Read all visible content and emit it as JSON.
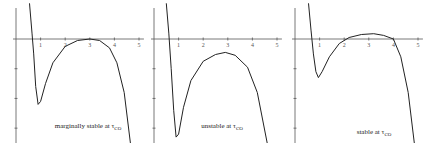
{
  "chart_data": [
    {
      "type": "line",
      "title": "",
      "caption": "marginally stable at τ",
      "caption_sub": "CO",
      "xlabel": "",
      "ylabel": "",
      "xlim": [
        0,
        5.2
      ],
      "ylim": [
        -3.5,
        1.2
      ],
      "x_ticks": [
        "1",
        "2",
        "3",
        "4",
        "5"
      ],
      "series": [
        {
          "name": "curve",
          "points": [
            [
              0.55,
              1.2
            ],
            [
              0.65,
              0.2
            ],
            [
              0.72,
              -0.5
            ],
            [
              0.8,
              -1.6
            ],
            [
              0.9,
              -2.2
            ],
            [
              1.0,
              -2.1
            ],
            [
              1.2,
              -1.5
            ],
            [
              1.5,
              -0.8
            ],
            [
              2.0,
              -0.25
            ],
            [
              2.5,
              -0.05
            ],
            [
              3.0,
              0.0
            ],
            [
              3.4,
              -0.05
            ],
            [
              3.8,
              -0.3
            ],
            [
              4.1,
              -0.8
            ],
            [
              4.4,
              -1.8
            ],
            [
              4.65,
              -3.5
            ]
          ]
        }
      ]
    },
    {
      "type": "line",
      "title": "",
      "caption": "unstable at τ",
      "caption_sub": "CO",
      "xlabel": "",
      "ylabel": "",
      "xlim": [
        0,
        5.2
      ],
      "ylim": [
        -3.5,
        1.2
      ],
      "x_ticks": [
        "1",
        "2",
        "3",
        "4",
        "5"
      ],
      "series": [
        {
          "name": "curve",
          "points": [
            [
              0.5,
              1.2
            ],
            [
              0.6,
              0.2
            ],
            [
              0.7,
              -1.0
            ],
            [
              0.8,
              -2.4
            ],
            [
              0.9,
              -3.3
            ],
            [
              1.0,
              -3.2
            ],
            [
              1.2,
              -2.3
            ],
            [
              1.5,
              -1.4
            ],
            [
              2.0,
              -0.75
            ],
            [
              2.5,
              -0.52
            ],
            [
              2.9,
              -0.45
            ],
            [
              3.3,
              -0.55
            ],
            [
              3.8,
              -0.95
            ],
            [
              4.2,
              -1.8
            ],
            [
              4.6,
              -3.5
            ]
          ]
        }
      ]
    },
    {
      "type": "line",
      "title": "",
      "caption": "stable at τ",
      "caption_sub": "CO",
      "xlabel": "",
      "ylabel": "",
      "xlim": [
        0,
        5.2
      ],
      "ylim": [
        -3.5,
        1.2
      ],
      "x_ticks": [
        "1",
        "2",
        "3",
        "4",
        "5"
      ],
      "series": [
        {
          "name": "curve",
          "points": [
            [
              0.55,
              1.2
            ],
            [
              0.65,
              0.3
            ],
            [
              0.75,
              -0.5
            ],
            [
              0.85,
              -1.1
            ],
            [
              0.95,
              -1.3
            ],
            [
              1.1,
              -1.1
            ],
            [
              1.4,
              -0.6
            ],
            [
              1.8,
              -0.15
            ],
            [
              2.2,
              0.05
            ],
            [
              2.7,
              0.15
            ],
            [
              3.2,
              0.18
            ],
            [
              3.6,
              0.12
            ],
            [
              4.0,
              0.0
            ],
            [
              4.3,
              -0.6
            ],
            [
              4.6,
              -1.8
            ],
            [
              4.85,
              -3.5
            ]
          ]
        }
      ]
    }
  ]
}
